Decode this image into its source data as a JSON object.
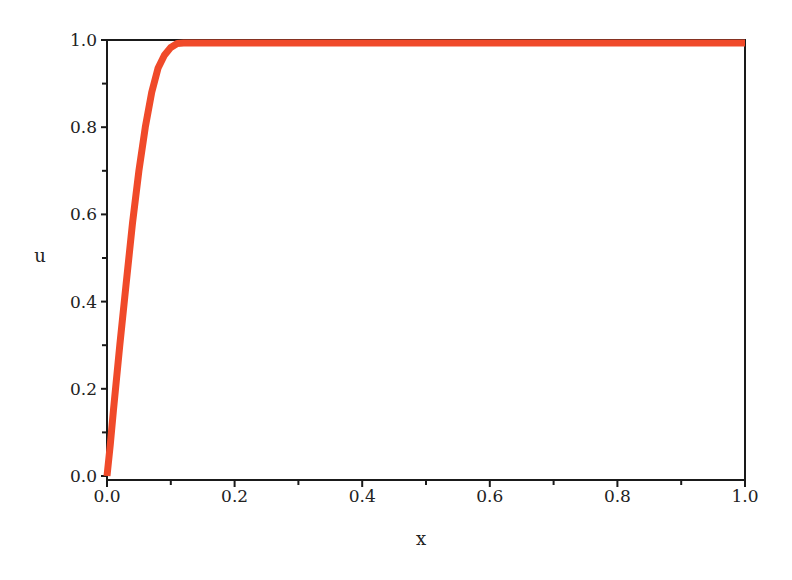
{
  "chart_data": {
    "type": "line",
    "title": "",
    "xlabel": "x",
    "ylabel": "u",
    "xlim": [
      0.0,
      1.0
    ],
    "ylim": [
      0.0,
      1.0
    ],
    "grid": false,
    "legend": null,
    "x_ticks": [
      "0.0",
      "0.2",
      "0.4",
      "0.6",
      "0.8",
      "1.0"
    ],
    "y_ticks": [
      "0.0",
      "0.2",
      "0.4",
      "0.6",
      "0.8",
      "1.0"
    ],
    "series": [
      {
        "name": "u(x)",
        "color": "#F04A2A",
        "x": [
          0.0,
          0.005,
          0.01,
          0.02,
          0.03,
          0.04,
          0.05,
          0.06,
          0.07,
          0.08,
          0.09,
          0.1,
          0.11,
          0.12,
          0.14,
          0.16,
          0.2,
          0.4,
          0.6,
          0.8,
          1.0
        ],
        "y": [
          0.0,
          0.07,
          0.15,
          0.3,
          0.44,
          0.58,
          0.7,
          0.8,
          0.88,
          0.935,
          0.965,
          0.983,
          0.992,
          0.997,
          0.999,
          1.0,
          1.0,
          1.0,
          1.0,
          1.0,
          0.995
        ]
      }
    ]
  },
  "colors": {
    "axis": "#1a1a1a",
    "curve": "#F04A2A",
    "background": "#ffffff"
  }
}
